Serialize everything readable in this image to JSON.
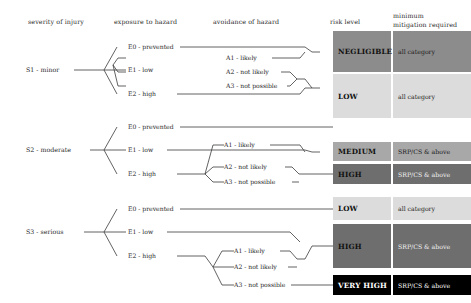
{
  "diagram": {
    "headers": [
      {
        "id": "severity",
        "label": "severity of injury",
        "x": 28,
        "y": 18
      },
      {
        "id": "exposure",
        "label": "exposure to hazard",
        "x": 114,
        "y": 18
      },
      {
        "id": "avoidance",
        "label": "avoidance of hazard",
        "x": 213,
        "y": 18
      },
      {
        "id": "risk-level",
        "label": "risk level",
        "x": 330,
        "y": 18
      },
      {
        "id": "mitigation",
        "label": "minimum\nmitigation required",
        "line1": "minimum",
        "line2": "mitigation required",
        "x": 393,
        "y": 14
      }
    ],
    "colors": {
      "negligible": "#8c8c8c",
      "low": "#dcdcdc",
      "medium": "#a8a8a8",
      "high": "#6e6e6e",
      "very_high": "#000000",
      "line": "#3b3b3b",
      "text_dark": "#1a1a1a",
      "text_light": "#ffffff"
    },
    "severity_levels": [
      {
        "id": "s1",
        "label": "S1 - minor",
        "x": 26,
        "y": 70
      },
      {
        "id": "s2",
        "label": "S2 - moderate",
        "x": 26,
        "y": 150
      },
      {
        "id": "s3",
        "label": "S3 - serious",
        "x": 26,
        "y": 232
      }
    ],
    "exposure_nodes": [
      {
        "id": "s1-e0",
        "label": "E0 - prevented",
        "x": 128,
        "y": 47
      },
      {
        "id": "s1-e1",
        "label": "E1 - low",
        "x": 128,
        "y": 70
      },
      {
        "id": "s1-e2",
        "label": "E2 - high",
        "x": 128,
        "y": 94
      },
      {
        "id": "s2-e0",
        "label": "E0 - prevented",
        "x": 128,
        "y": 127
      },
      {
        "id": "s2-e1",
        "label": "E1 - low",
        "x": 128,
        "y": 150
      },
      {
        "id": "s2-e2",
        "label": "E2 - high",
        "x": 128,
        "y": 174
      },
      {
        "id": "s3-e0",
        "label": "E0 - prevented",
        "x": 128,
        "y": 209
      },
      {
        "id": "s3-e1",
        "label": "E1 - low",
        "x": 128,
        "y": 232
      },
      {
        "id": "s3-e2",
        "label": "E2 - high",
        "x": 128,
        "y": 256
      }
    ],
    "avoidance_nodes": [
      {
        "id": "s1-a1",
        "label": "A1 - likely",
        "x": 226,
        "y": 58
      },
      {
        "id": "s1-a2",
        "label": "A2 - not likely",
        "x": 226,
        "y": 72
      },
      {
        "id": "s1-a3",
        "label": "A3 - not possible",
        "x": 226,
        "y": 86
      },
      {
        "id": "s2-a1",
        "label": "A1 - likely",
        "x": 226,
        "y": 145
      },
      {
        "id": "s2-a2",
        "label": "A2 - not likely",
        "x": 226,
        "y": 167
      },
      {
        "id": "s2-a3",
        "label": "A3 - not possible",
        "x": 226,
        "y": 182
      },
      {
        "id": "s3-a1",
        "label": "A1 - likely",
        "x": 236,
        "y": 251
      },
      {
        "id": "s3-a2",
        "label": "A2 - not likely",
        "x": 236,
        "y": 267
      },
      {
        "id": "s3-a3",
        "label": "A3 - not possible",
        "x": 236,
        "y": 285
      }
    ],
    "risk_boxes": [
      {
        "id": "risk-negligible",
        "label": "NEGLIGIBLE",
        "mitigation": "all category",
        "x": 333,
        "y": 31,
        "w": 58,
        "h": 41,
        "mx": 393,
        "mw": 78,
        "bg": "#8c8c8c",
        "fg": "#111111",
        "mit_bg": "#8c8c8c",
        "mit_fg": "#1a1a1a",
        "risk_valign": "center",
        "mit_valign": "center"
      },
      {
        "id": "risk-low-1",
        "label": "LOW",
        "mitigation": "all category",
        "x": 333,
        "y": 74,
        "w": 58,
        "h": 44,
        "mx": 393,
        "mw": 78,
        "bg": "#dcdcdc",
        "fg": "#111111",
        "mit_bg": "#dcdcdc",
        "mit_fg": "#1a1a1a",
        "risk_valign": "center",
        "mit_valign": "center"
      },
      {
        "id": "risk-medium",
        "label": "MEDIUM",
        "mitigation": "SRP/CS & above",
        "x": 333,
        "y": 142,
        "w": 58,
        "h": 19,
        "mx": 393,
        "mw": 78,
        "bg": "#a8a8a8",
        "fg": "#111111",
        "mit_bg": "#a8a8a8",
        "mit_fg": "#1a1a1a",
        "risk_valign": "center",
        "mit_valign": "center"
      },
      {
        "id": "risk-high-1",
        "label": "HIGH",
        "mitigation": "SRP/CS & above",
        "x": 333,
        "y": 164,
        "w": 58,
        "h": 20,
        "mx": 393,
        "mw": 78,
        "bg": "#6e6e6e",
        "fg": "#111111",
        "mit_bg": "#6e6e6e",
        "mit_fg": "#f2f2f2",
        "risk_valign": "center",
        "mit_valign": "center"
      },
      {
        "id": "risk-low-2",
        "label": "LOW",
        "mitigation": "all category",
        "x": 333,
        "y": 197,
        "w": 58,
        "h": 23,
        "mx": 393,
        "mw": 78,
        "bg": "#dcdcdc",
        "fg": "#111111",
        "mit_bg": "#dcdcdc",
        "mit_fg": "#1a1a1a",
        "risk_valign": "center",
        "mit_valign": "center"
      },
      {
        "id": "risk-high-2",
        "label": "HIGH",
        "mitigation": "SRP/CS & above",
        "x": 333,
        "y": 224,
        "w": 58,
        "h": 44,
        "mx": 393,
        "mw": 78,
        "bg": "#6e6e6e",
        "fg": "#111111",
        "mit_bg": "#6e6e6e",
        "mit_fg": "#f2f2f2",
        "risk_valign": "center",
        "mit_valign": "center"
      },
      {
        "id": "risk-very-high",
        "label": "VERY HIGH",
        "mitigation": "SRP/CS & above",
        "x": 333,
        "y": 275,
        "w": 58,
        "h": 20,
        "mx": 393,
        "mw": 78,
        "bg": "#000000",
        "fg": "#ffffff",
        "mit_bg": "#000000",
        "mit_fg": "#ffffff",
        "risk_valign": "center",
        "mit_valign": "center"
      }
    ],
    "paths": {
      "s1": "M74,70 H104 M104,70 L117,47 M104,70 H126 M104,70 L117,94 M180,47 H305 L312,52 L320,52 M118,58 L126,58 M118,58 L113,65 M113,65 L118,72 M118,72 L126,72 M113,65 L118,86 M118,86 L126,86 M272,58 H300 L305,52 M281,72 H290 L297,79 M287,86 H290 L297,79 M297,79 H305 L312,88 L320,88 M177,94 H300 L305,88 M305,88 H312",
      "s2": "M90,150 H104 M104,150 L117,127 M104,150 H126 M104,150 L117,174 M180,127 H333 M167,150 H305 L312,152 L320,152 M177,174 H205 M205,174 L213,145 M213,145 H224 M205,174 L213,167 M213,167 H224 M205,174 L213,182 M213,182 H224 M270,145 H300 L305,152 M285,167 H292 L299,174 M292,182 H299 M299,174 H312 L320,174 M320,174 H333",
      "s3": "M84,232 H104 M104,232 L117,209 M104,232 H126 M104,232 L117,256 M180,209 H333 M167,232 H290 L300,242 M177,256 H205 L213,267 M213,267 H234 M213,267 L222,251 M222,251 H234 M213,267 L222,285 M222,285 H234 M280,251 H290 L297,259 M288,267 H297 M297,259 H305 L312,246 M312,246 H333 M291,285 H333"
    }
  }
}
